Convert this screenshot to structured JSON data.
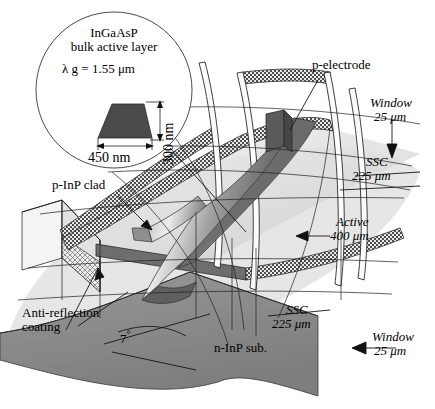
{
  "figure": {
    "domain": "technical-diagram",
    "background": "#ffffff",
    "ink": "#000000"
  },
  "inset": {
    "shape": "circle",
    "title_line1": "InGaAsP",
    "title_line2": "bulk active layer",
    "wavelength": "λ g = 1.55 μm",
    "height_label": "300 nm",
    "width_label": "450 nm",
    "trapezoid_fill": "#4a4a4a"
  },
  "labels": {
    "p_electrode": "p-electrode",
    "p_inp_clad": "p-InP clad",
    "anti_reflection_line1": "Anti-reflection",
    "anti_reflection_line2": "coating",
    "angle": "7",
    "angle_unit": "°",
    "n_inp_sub": "n-InP sub.",
    "window_right_name": "Window",
    "window_right_value": "25  μm",
    "ssc_right_name": "SSC",
    "ssc_right_value": "225  μm",
    "active_name": "Active",
    "active_value": "400  μm",
    "ssc_bottom_name": "SSC",
    "ssc_bottom_value": "225  μm",
    "window_bottom_name": "Window",
    "window_bottom_value": "25  μm"
  },
  "colors": {
    "substrate_gray": "#8c8c8c",
    "top_surface_pale": "#e9e9e9",
    "shadow_gray": "#d2d2d2",
    "ridge_dark": "#6a6a6a",
    "ridge_mid": "#9a9a9a",
    "ridge_light": "#cfcfcf",
    "electrode_dark": "#5a5a5a",
    "hatch_ribbon": "#555555"
  },
  "dimensions": {
    "width": 435,
    "height": 409
  }
}
